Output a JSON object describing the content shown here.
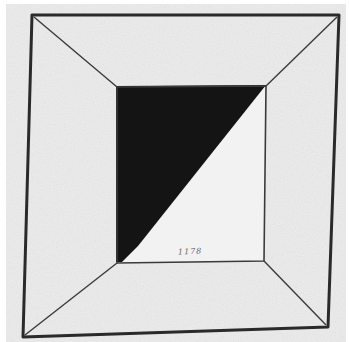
{
  "artwork": {
    "description": "Pencil drawing of a square frame in perspective with a black triangle in the inner square",
    "inscription": "1178",
    "colors": {
      "paper": "#ececec",
      "paper_edge": "#ffffff",
      "line": "#2a2a2a",
      "fill": "#141414"
    },
    "outer_square": {
      "top_left": [
        32,
        15
      ],
      "top_right": [
        339,
        15
      ],
      "bottom_right": [
        328,
        327
      ],
      "bottom_left": [
        23,
        337
      ]
    },
    "inner_square": {
      "top_left": [
        117,
        87
      ],
      "top_right": [
        266,
        86
      ],
      "bottom_right": [
        264,
        261
      ],
      "bottom_left": [
        117,
        263
      ]
    },
    "black_triangle": {
      "points": [
        [
          117,
          87
        ],
        [
          266,
          86
        ],
        [
          120,
          262
        ]
      ]
    }
  }
}
